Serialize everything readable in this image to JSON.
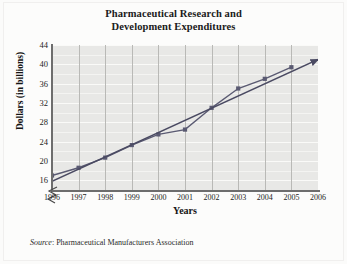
{
  "chart_data": {
    "type": "line",
    "title": "Pharmaceutical Research and Development Expenditures",
    "title_line1": "Pharmaceutical Research and",
    "title_line2": "Development Expenditures",
    "xlabel": "Years",
    "ylabel": "Dollars (in billions)",
    "categories": [
      "1996",
      "1997",
      "1998",
      "1999",
      "2000",
      "2001",
      "2002",
      "2003",
      "2004",
      "2005",
      "2006"
    ],
    "x": [
      1996,
      1997,
      1998,
      1999,
      2000,
      2001,
      2002,
      2003,
      2004,
      2005,
      2006
    ],
    "ylim": [
      14,
      44
    ],
    "xlim": [
      1996,
      2006
    ],
    "yticks": [
      44,
      40,
      36,
      32,
      28,
      24,
      20,
      16
    ],
    "ytick_labels": [
      "44",
      "40",
      "36",
      "32",
      "28",
      "24",
      "20",
      "16"
    ],
    "y_minor_step": 2,
    "grid": "both",
    "legend": "none",
    "axis_break": true,
    "series": [
      {
        "name": "R&D expenditures",
        "type": "line-markers",
        "color": "#5a5a72",
        "x": [
          1996,
          1997,
          1998,
          1999,
          2000,
          2001,
          2002,
          2003,
          2004,
          2005
        ],
        "values": [
          17.0,
          18.6,
          20.7,
          23.3,
          25.5,
          26.5,
          31.0,
          35.0,
          37.0,
          39.4
        ]
      },
      {
        "name": "Trend line",
        "type": "line-arrow",
        "color": "#4a4a62",
        "x": [
          1996,
          2006
        ],
        "values": [
          15.8,
          41.0
        ]
      }
    ],
    "source_prefix": "Source",
    "source_text": ": Pharmaceutical Manufacturers Association",
    "source_full": "Source: Pharmaceutical Manufacturers Association"
  },
  "colors": {
    "plot_background": "#e8e8e6",
    "axis": "#6d6d6d",
    "gridline_vertical": "#b9b9b6",
    "gridline_horizontal": "#f4f4f2",
    "data_line": "#5a5a72",
    "text": "#1a1a1a",
    "page_background": "#fbfbfa"
  }
}
